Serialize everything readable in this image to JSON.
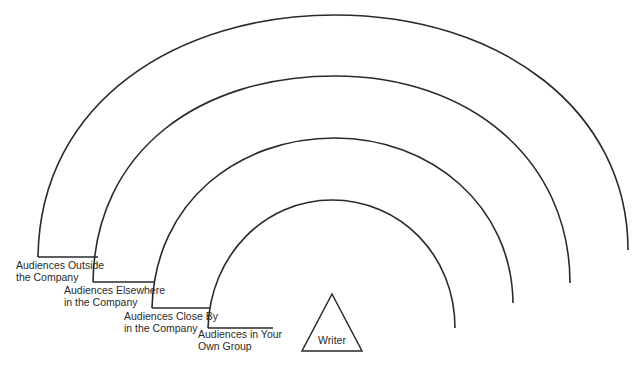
{
  "diagram": {
    "type": "concentric-audience-arcs",
    "writer_label": "Writer",
    "rings": [
      {
        "id": "outside",
        "line1": "Audiences Outside",
        "line2": "the Company"
      },
      {
        "id": "elsewhere",
        "line1": "Audiences Elsewhere",
        "line2": "in the Company"
      },
      {
        "id": "close-by",
        "line1": "Audiences Close By",
        "line2": "in the Company"
      },
      {
        "id": "own-group",
        "line1": "Audiences in Your",
        "line2": "Own Group"
      }
    ]
  }
}
